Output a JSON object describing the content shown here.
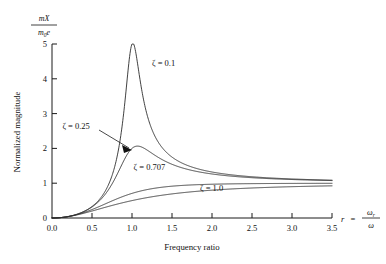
{
  "chart_data": {
    "type": "line",
    "title": "",
    "subtitle": "",
    "xlabel": "Frequency ratio",
    "ylabel": "Normalized magnitude",
    "xlim": [
      0.0,
      3.5
    ],
    "ylim": [
      0,
      5
    ],
    "xticks": [
      "0.0",
      "0.5",
      "1.0",
      "1.5",
      "2.0",
      "2.5",
      "3.0",
      "3.5"
    ],
    "xtick_values": [
      0.0,
      0.5,
      1.0,
      1.5,
      2.0,
      2.5,
      3.0,
      3.5
    ],
    "yticks": [
      "0",
      "1",
      "2",
      "3",
      "4",
      "5"
    ],
    "ytick_values": [
      0,
      1,
      2,
      3,
      4,
      5
    ],
    "grid": false,
    "legend_position": "inline-annotations",
    "formula": "r^2 / sqrt((1-r^2)^2 + (2*z*r)^2)",
    "series": [
      {
        "name": "zeta-0.1",
        "label": "ζ = 0.1",
        "zeta": 0.1,
        "label_x": 1.25,
        "label_y": 4.38,
        "peak_x": 1.01,
        "peak_y": 5.02,
        "x": [
          0.0,
          0.1,
          0.2,
          0.3,
          0.4,
          0.5,
          0.6,
          0.7,
          0.8,
          0.9,
          0.95,
          1.0,
          1.05,
          1.1,
          1.2,
          1.3,
          1.5,
          1.75,
          2.0,
          2.5,
          3.0,
          3.5
        ],
        "values": [
          0.0,
          0.01,
          0.042,
          0.099,
          0.19,
          0.33,
          0.56,
          0.95,
          1.73,
          3.36,
          4.61,
          5.0,
          4.23,
          3.07,
          1.81,
          1.3,
          0.95,
          0.85,
          0.83,
          0.86,
          0.92,
          0.96
        ]
      },
      {
        "name": "zeta-0.25",
        "label": "ζ = 0.25",
        "zeta": 0.25,
        "label_x": 0.13,
        "label_y": 2.56,
        "peak_x": 1.07,
        "peak_y": 2.07,
        "annotation": "arrow-leader-to-peak",
        "x": [
          0.0,
          0.2,
          0.4,
          0.6,
          0.8,
          0.9,
          1.0,
          1.1,
          1.2,
          1.4,
          1.6,
          2.0,
          2.5,
          3.0,
          3.5
        ],
        "values": [
          0.0,
          0.042,
          0.188,
          0.528,
          1.29,
          1.78,
          2.0,
          2.06,
          1.76,
          1.26,
          1.08,
          0.95,
          0.95,
          0.97,
          0.99
        ]
      },
      {
        "name": "zeta-0.707",
        "label": "ζ = 0.707",
        "zeta": 0.707,
        "label_x": 1.02,
        "label_y": 1.38,
        "peak_x": null,
        "peak_y": null,
        "x": [
          0.0,
          0.2,
          0.4,
          0.6,
          0.8,
          1.0,
          1.2,
          1.5,
          2.0,
          2.5,
          3.0,
          3.5
        ],
        "values": [
          0.0,
          0.04,
          0.165,
          0.37,
          0.63,
          0.71,
          0.86,
          0.96,
          1.0,
          1.02,
          1.02,
          1.02
        ]
      },
      {
        "name": "zeta-1.0",
        "label": "ζ = 1.0",
        "zeta": 1.0,
        "label_x": 1.85,
        "label_y": 0.78,
        "peak_x": null,
        "peak_y": null,
        "x": [
          0.0,
          0.2,
          0.4,
          0.6,
          0.8,
          1.0,
          1.2,
          1.5,
          2.0,
          2.5,
          3.0,
          3.5
        ],
        "values": [
          0.0,
          0.038,
          0.145,
          0.3,
          0.49,
          0.5,
          0.69,
          0.83,
          0.93,
          0.96,
          0.98,
          0.99
        ]
      }
    ]
  },
  "axes": {
    "y_axis_fraction": {
      "numerator": "mX",
      "denominator_m": "m",
      "denominator_sub": "0",
      "denominator_e": "e"
    },
    "x_axis_right_label": {
      "variable": "r",
      "equals": "=",
      "num": "ω",
      "num_sub": "r",
      "den": "ω"
    }
  }
}
